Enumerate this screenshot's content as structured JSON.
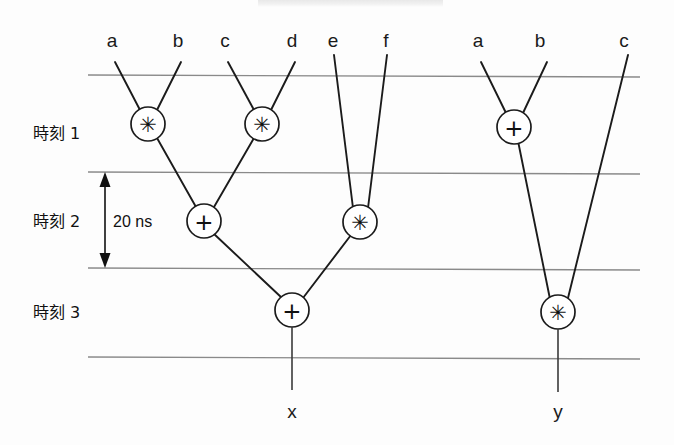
{
  "figure": {
    "title_visible": false,
    "background_color": "#fdfdfd",
    "line_color": "#8a8a8a",
    "edge_color": "#1b1b1b"
  },
  "time_rows": [
    {
      "id": "row1",
      "label": "時刻 1"
    },
    {
      "id": "row2",
      "label": "時刻 2"
    },
    {
      "id": "row3",
      "label": "時刻 3"
    }
  ],
  "measurement": {
    "label": "20  ns",
    "from_row": "row1",
    "to_row": "row2"
  },
  "inputs": [
    {
      "id": "in-a-left",
      "label": "a",
      "x": 112
    },
    {
      "id": "in-b-left",
      "label": "b",
      "x": 178
    },
    {
      "id": "in-c-left",
      "label": "c",
      "x": 225
    },
    {
      "id": "in-d-left",
      "label": "d",
      "x": 292
    },
    {
      "id": "in-e",
      "label": "e",
      "x": 333
    },
    {
      "id": "in-f",
      "label": "f",
      "x": 386
    },
    {
      "id": "in-a-right",
      "label": "a",
      "x": 478
    },
    {
      "id": "in-b-right",
      "label": "b",
      "x": 540
    },
    {
      "id": "in-c-right",
      "label": "c",
      "x": 624
    }
  ],
  "operators": [
    {
      "id": "op-mul-ab",
      "glyph": "✳",
      "kind": "multiply",
      "row": "row1",
      "cx": 148,
      "cy": 124
    },
    {
      "id": "op-mul-cd",
      "glyph": "✳",
      "kind": "multiply",
      "row": "row1",
      "cx": 262,
      "cy": 124
    },
    {
      "id": "op-add-right",
      "glyph": "+",
      "kind": "add",
      "row": "row1",
      "cx": 514,
      "cy": 127
    },
    {
      "id": "op-add-mid",
      "glyph": "+",
      "kind": "add",
      "row": "row2",
      "cx": 204,
      "cy": 221
    },
    {
      "id": "op-mul-ef",
      "glyph": "✳",
      "kind": "multiply",
      "row": "row2",
      "cx": 360,
      "cy": 222
    },
    {
      "id": "op-add-final",
      "glyph": "+",
      "kind": "add",
      "row": "row3",
      "cx": 292,
      "cy": 310
    },
    {
      "id": "op-mul-final",
      "glyph": "✳",
      "kind": "multiply",
      "row": "row3",
      "cx": 558,
      "cy": 312
    }
  ],
  "outputs": [
    {
      "id": "out-x",
      "label": "x",
      "x": 292
    },
    {
      "id": "out-y",
      "label": "y",
      "x": 558
    }
  ]
}
